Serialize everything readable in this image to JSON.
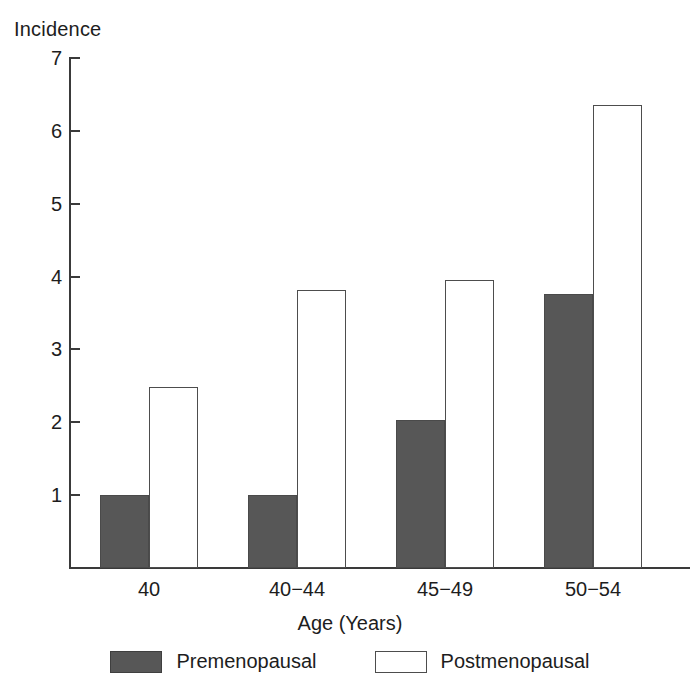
{
  "chart_data": {
    "type": "bar",
    "title": "",
    "ylabel": "Incidence",
    "xlabel": "Age (Years)",
    "categories": [
      "40",
      "40−44",
      "45−49",
      "50−54"
    ],
    "series": [
      {
        "name": "Premenopausal",
        "values": [
          1.0,
          1.0,
          2.03,
          3.76
        ],
        "color": "#575757",
        "fill": "solid"
      },
      {
        "name": "Postmenopausal",
        "values": [
          2.48,
          3.82,
          3.96,
          6.35
        ],
        "color": "#ffffff",
        "fill": "outline"
      }
    ],
    "ylim": [
      0,
      7
    ],
    "yticks": [
      1,
      2,
      3,
      4,
      5,
      6,
      7
    ],
    "ytick_labels": [
      "1",
      "2",
      "3",
      "4",
      "5",
      "6",
      "7"
    ],
    "grid": false,
    "legend_position": "bottom",
    "axis_color": "#3a3a3a",
    "background": "#ffffff"
  },
  "axis": {
    "y_title": "Incidence",
    "x_title": "Age (Years)"
  },
  "legend": {
    "items": [
      {
        "label": "Premenopausal",
        "style": "filled"
      },
      {
        "label": "Postmenopausal",
        "style": "outline"
      }
    ]
  }
}
